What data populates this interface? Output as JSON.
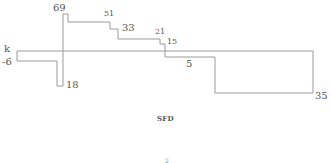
{
  "diagram": {
    "title": "SFD",
    "stroke_color": "#9a9a9a",
    "labels": {
      "k": "k",
      "v_neg6": "-6",
      "v_69": "69",
      "v_18": "18",
      "v_51": "51",
      "v_33": "33",
      "v_21": "21",
      "v_15": "15",
      "v_5": "5",
      "v_35": "35"
    },
    "segments_shear": [
      {
        "from_x": 17,
        "to_x": 63,
        "value": -6
      },
      {
        "from_x": 63,
        "to_x": 68,
        "value": 69
      },
      {
        "from_x": 68,
        "to_x": 110,
        "value": 51
      },
      {
        "from_x": 110,
        "to_x": 118,
        "value": 33
      },
      {
        "from_x": 118,
        "to_x": 160,
        "value": 21
      },
      {
        "from_x": 160,
        "to_x": 165,
        "value": 15
      },
      {
        "from_x": 165,
        "to_x": 215,
        "value": -5
      },
      {
        "from_x": 215,
        "to_x": 313,
        "value": -35
      }
    ],
    "partial_text_below": "2"
  }
}
